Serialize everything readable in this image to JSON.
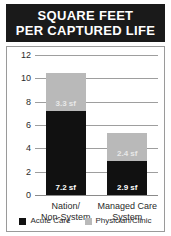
{
  "title": {
    "line1": "SQUARE FEET",
    "line2": "PER CAPTURED LIFE"
  },
  "colors": {
    "banner_bg": "#1a1a1a",
    "banner_text": "#ffffff",
    "acute_care": "#111111",
    "physician_clinic": "#b9b9b9",
    "gridline": "#9e9e9e",
    "frame_border": "#9a9a9a",
    "background": "#ffffff"
  },
  "chart_data": {
    "type": "bar",
    "title": "SQUARE FEET PER CAPTURED LIFE",
    "subtitle": "",
    "xlabel": "",
    "ylabel": "",
    "stacked": true,
    "grid": true,
    "legend_position": "bottom",
    "ylim": [
      0,
      12
    ],
    "yticks": [
      0,
      2,
      4,
      6,
      8,
      10,
      12
    ],
    "ytick_labels": [
      "0",
      "2",
      "4",
      "6",
      "8",
      "10",
      "12"
    ],
    "categories": [
      "Nation/ Non-System",
      "Managed Care System"
    ],
    "category_lines": [
      [
        "Nation/",
        "Non-System"
      ],
      [
        "Managed Care",
        "System"
      ]
    ],
    "series": [
      {
        "name": "Acute Care",
        "color": "#111111",
        "values": [
          7.2,
          2.9
        ],
        "value_labels": [
          "7.2 sf",
          "2.9 sf"
        ]
      },
      {
        "name": "Physician/Clinic",
        "color": "#b9b9b9",
        "values": [
          3.3,
          2.4
        ],
        "value_labels": [
          "3.3 sf",
          "2.4 sf"
        ]
      }
    ],
    "totals": [
      10.5,
      5.3
    ]
  },
  "legend": {
    "items": [
      {
        "label": "Acute Care",
        "color": "#111111"
      },
      {
        "label": "Physician/Clinic",
        "color": "#b9b9b9"
      }
    ]
  }
}
